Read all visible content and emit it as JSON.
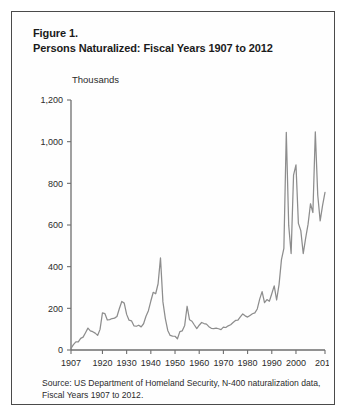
{
  "figure": {
    "title_line_1": "Figure 1.",
    "title_line_2": "Persons Naturalized: Fiscal Years 1907 to 2012",
    "unit_label": "Thousands",
    "source_note": "Source: US Department of Homeland Security, N-400 naturalization data, Fiscal Years 1907 to 2012."
  },
  "chart_data": {
    "type": "line",
    "title": "Persons Naturalized: Fiscal Years 1907 to 2012",
    "xlabel": "",
    "ylabel": "Thousands",
    "ylim": [
      0,
      1200
    ],
    "xlim": [
      1907,
      2012
    ],
    "grid": false,
    "legend": false,
    "line_color": "#8d8d8d",
    "y_ticks": [
      0,
      200,
      400,
      600,
      800,
      1000,
      1200
    ],
    "y_tick_labels": [
      "0",
      "200",
      "400",
      "600",
      "800",
      "1,000",
      "1,200"
    ],
    "x_ticks": [
      1907,
      1920,
      1930,
      1940,
      1950,
      1960,
      1970,
      1980,
      1990,
      2000,
      2012
    ],
    "x_tick_labels": [
      "1907",
      "1920",
      "1930",
      "1940",
      "1950",
      "1960",
      "1970",
      "1980",
      "1990",
      "2000",
      "2012"
    ],
    "x": [
      1907,
      1908,
      1909,
      1910,
      1911,
      1912,
      1913,
      1914,
      1915,
      1916,
      1917,
      1918,
      1919,
      1920,
      1921,
      1922,
      1923,
      1924,
      1925,
      1926,
      1927,
      1928,
      1929,
      1930,
      1931,
      1932,
      1933,
      1934,
      1935,
      1936,
      1937,
      1938,
      1939,
      1940,
      1941,
      1942,
      1943,
      1944,
      1945,
      1946,
      1947,
      1948,
      1949,
      1950,
      1951,
      1952,
      1953,
      1954,
      1955,
      1956,
      1957,
      1958,
      1959,
      1960,
      1961,
      1962,
      1963,
      1964,
      1965,
      1966,
      1967,
      1968,
      1969,
      1970,
      1971,
      1972,
      1973,
      1974,
      1975,
      1976,
      1977,
      1978,
      1979,
      1980,
      1981,
      1982,
      1983,
      1984,
      1985,
      1986,
      1987,
      1988,
      1989,
      1990,
      1991,
      1992,
      1993,
      1994,
      1995,
      1996,
      1997,
      1998,
      1999,
      2000,
      2001,
      2002,
      2003,
      2004,
      2005,
      2006,
      2007,
      2008,
      2009,
      2010,
      2011,
      2012
    ],
    "values": [
      8,
      26,
      39,
      39,
      56,
      62,
      83,
      105,
      92,
      88,
      81,
      70,
      99,
      178,
      175,
      144,
      146,
      151,
      153,
      161,
      199,
      233,
      225,
      171,
      143,
      140,
      116,
      114,
      119,
      111,
      126,
      162,
      189,
      235,
      277,
      270,
      318,
      442,
      231,
      151,
      94,
      70,
      67,
      66,
      54,
      88,
      92,
      118,
      210,
      145,
      138,
      120,
      103,
      119,
      132,
      127,
      124,
      112,
      104,
      103,
      105,
      102,
      98,
      110,
      108,
      116,
      121,
      132,
      142,
      143,
      159,
      173,
      164,
      158,
      166,
      174,
      178,
      197,
      244,
      280,
      227,
      242,
      234,
      270,
      308,
      240,
      314,
      434,
      488,
      1045,
      598,
      463,
      839,
      889,
      608,
      573,
      463,
      537,
      604,
      702,
      660,
      1047,
      744,
      620,
      694,
      757
    ]
  }
}
